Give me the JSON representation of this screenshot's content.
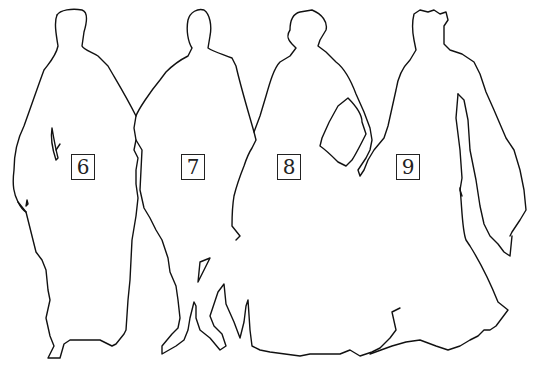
{
  "figure": {
    "stroke_color": "#111111",
    "background": "#ffffff",
    "silhouettes": [
      {
        "label": "6",
        "box": {
          "x": 71,
          "y": 154
        }
      },
      {
        "label": "7",
        "box": {
          "x": 181,
          "y": 154
        }
      },
      {
        "label": "8",
        "box": {
          "x": 277,
          "y": 154
        }
      },
      {
        "label": "9",
        "box": {
          "x": 396,
          "y": 154
        }
      }
    ]
  }
}
